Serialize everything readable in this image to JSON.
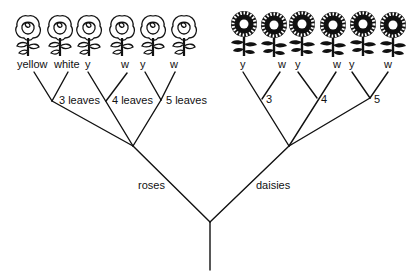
{
  "diagram": {
    "type": "tree",
    "root": {
      "label": ""
    },
    "branches": [
      {
        "label": "roses",
        "subgroups": [
          {
            "label": "3 leaves",
            "leaves": [
              "yellow",
              "white"
            ]
          },
          {
            "label": "4 leaves",
            "leaves": [
              "y",
              "w"
            ]
          },
          {
            "label": "5 leaves",
            "leaves": [
              "y",
              "w"
            ]
          }
        ]
      },
      {
        "label": "daisies",
        "subgroups": [
          {
            "label": "3",
            "leaves": [
              "y",
              "w"
            ]
          },
          {
            "label": "4",
            "leaves": [
              "y",
              "w"
            ]
          },
          {
            "label": "5",
            "leaves": [
              "y",
              "w"
            ]
          }
        ]
      }
    ],
    "icons": {
      "roses": [
        "rose-icon",
        "rose-icon",
        "rose-icon",
        "rose-icon",
        "rose-icon",
        "rose-icon"
      ],
      "daisies": [
        "daisy-icon",
        "daisy-icon",
        "daisy-icon",
        "daisy-icon",
        "daisy-icon",
        "daisy-icon"
      ]
    }
  }
}
